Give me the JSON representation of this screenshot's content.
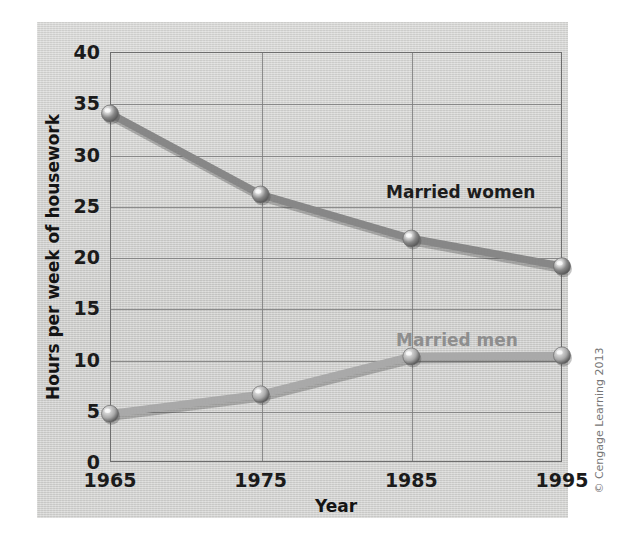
{
  "chart_data": {
    "type": "line",
    "title": "",
    "xlabel": "Year",
    "ylabel": "Hours per week of housework",
    "x": [
      1965,
      1975,
      1985,
      1995
    ],
    "categories": [
      "1965",
      "1975",
      "1985",
      "1995"
    ],
    "xtick_labels": [
      "1965",
      "1975",
      "1985",
      "1995"
    ],
    "ytick_labels": [
      "0",
      "5",
      "10",
      "15",
      "20",
      "25",
      "30",
      "35",
      "40"
    ],
    "yticks": [
      0,
      5,
      10,
      15,
      20,
      25,
      30,
      35,
      40
    ],
    "ylim": [
      0,
      40
    ],
    "xlim": [
      1965,
      1995
    ],
    "grid": true,
    "legend_position": "inline-annotations",
    "series": [
      {
        "name": "Married women",
        "values": [
          34.0,
          26.1,
          21.8,
          19.1
        ],
        "color": "#878787",
        "label_color": "#1d1d1d"
      },
      {
        "name": "Married men",
        "values": [
          4.7,
          6.6,
          10.3,
          10.4
        ],
        "color": "#a9a9a9",
        "label_color": "#8e8e8e"
      }
    ],
    "annotations": [
      {
        "text": "Married women",
        "series": "Married women"
      },
      {
        "text": "Married men",
        "series": "Married men"
      }
    ]
  },
  "figure": {
    "credit": "© Cengage Learning 2013",
    "panel_color": "#cfcfcd",
    "axis_color": "#6e6e6e",
    "grid_color": "#7d7d7d"
  }
}
